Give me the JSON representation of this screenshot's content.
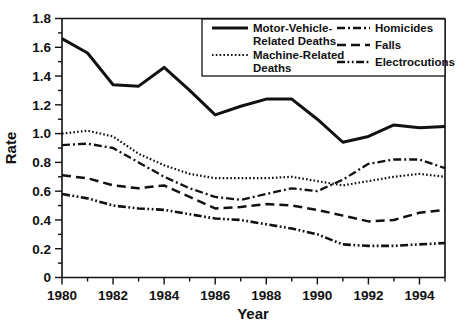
{
  "chart_data": {
    "type": "line",
    "title": "",
    "xlabel": "Year",
    "ylabel": "Rate",
    "xlim": [
      1980,
      1995
    ],
    "ylim": [
      0,
      1.8
    ],
    "ytick_labels": [
      "0",
      "0.2",
      "0.4",
      "0.6",
      "0.8",
      "1.0",
      "1.2",
      "1.4",
      "1.6",
      "1.8"
    ],
    "ytick_values": [
      0,
      0.2,
      0.4,
      0.6,
      0.8,
      1.0,
      1.2,
      1.4,
      1.6,
      1.8
    ],
    "xtick_labels": [
      "1980",
      "1982",
      "1984",
      "1986",
      "1988",
      "1990",
      "1992",
      "1994"
    ],
    "xtick_values": [
      1980,
      1982,
      1984,
      1986,
      1988,
      1990,
      1992,
      1994
    ],
    "x_minor_ticks": [
      1981,
      1983,
      1985,
      1987,
      1989,
      1991,
      1993,
      1995
    ],
    "y_minor_ticks": [
      0.1,
      0.3,
      0.5,
      0.7,
      0.9,
      1.1,
      1.3,
      1.5,
      1.7
    ],
    "grid": false,
    "legend_position": "top-right",
    "x": [
      1980,
      1981,
      1982,
      1983,
      1984,
      1985,
      1986,
      1987,
      1988,
      1989,
      1990,
      1991,
      1992,
      1993,
      1994,
      1995
    ],
    "series": [
      {
        "name": "Motor-Vehicle-Related Deaths",
        "style": "solid",
        "dasharray": "",
        "width": 3.0,
        "values": [
          1.66,
          1.56,
          1.34,
          1.33,
          1.46,
          1.3,
          1.13,
          1.19,
          1.24,
          1.24,
          1.1,
          0.94,
          0.98,
          1.06,
          1.04,
          1.05
        ]
      },
      {
        "name": "Machine-Related Deaths",
        "style": "dotted",
        "dasharray": "1.6,2.2",
        "width": 2.2,
        "values": [
          1.0,
          1.02,
          0.98,
          0.86,
          0.78,
          0.72,
          0.69,
          0.69,
          0.69,
          0.7,
          0.67,
          0.64,
          0.67,
          0.7,
          0.72,
          0.7
        ]
      },
      {
        "name": "Homicides",
        "style": "dashdot",
        "dasharray": "8,3,2,3",
        "width": 2.3,
        "values": [
          0.92,
          0.93,
          0.9,
          0.8,
          0.7,
          0.62,
          0.56,
          0.54,
          0.58,
          0.62,
          0.6,
          0.68,
          0.79,
          0.82,
          0.82,
          0.76
        ]
      },
      {
        "name": "Falls",
        "style": "dashed",
        "dasharray": "9,5",
        "width": 2.5,
        "values": [
          0.71,
          0.69,
          0.64,
          0.62,
          0.64,
          0.56,
          0.48,
          0.49,
          0.51,
          0.5,
          0.47,
          0.43,
          0.39,
          0.4,
          0.45,
          0.47
        ]
      },
      {
        "name": "Electrocutions",
        "style": "dashdotdot",
        "dasharray": "8,2.5,1.8,2.5,1.8,2.5",
        "width": 2.6,
        "values": [
          0.58,
          0.55,
          0.5,
          0.48,
          0.47,
          0.44,
          0.41,
          0.4,
          0.37,
          0.34,
          0.3,
          0.23,
          0.22,
          0.22,
          0.23,
          0.24
        ]
      }
    ]
  },
  "legend": {
    "entries": [
      {
        "label_line1": "Motor-Vehicle-",
        "label_line2": "Related Deaths"
      },
      {
        "label_line1": "Machine-Related",
        "label_line2": "Deaths"
      },
      {
        "label_line1": "Homicides",
        "label_line2": ""
      },
      {
        "label_line1": "Falls",
        "label_line2": ""
      },
      {
        "label_line1": "Electrocutions",
        "label_line2": ""
      }
    ]
  },
  "colors": {
    "ink": "#111111",
    "background": "#ffffff"
  }
}
